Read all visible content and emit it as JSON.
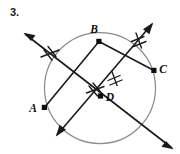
{
  "figure": {
    "problem_number": "3.",
    "canvas": {
      "width": 180,
      "height": 154
    },
    "colors": {
      "ink": "#1a1a1a",
      "circle_stroke": "#8c8c8c",
      "background": "#ffffff",
      "vertex": "#0d0d0d"
    },
    "circle": {
      "name": "circle",
      "cx": 100,
      "cy": 88,
      "r": 55.5
    },
    "points": [
      {
        "id": "A",
        "label": "A",
        "x": 44.5,
        "y": 107.5,
        "label_x": 34.5,
        "label_y": 111.0
      },
      {
        "id": "B",
        "label": "B",
        "x": 99.0,
        "y": 41.5,
        "label_x": 93.0,
        "label_y": 33.0
      },
      {
        "id": "C",
        "label": "C",
        "x": 154.0,
        "y": 70.5,
        "label_x": 160.5,
        "label_y": 72.0
      },
      {
        "id": "D",
        "label": "D",
        "x": 100.5,
        "y": 96.0,
        "label_x": 107.0,
        "label_y": 100.5
      }
    ],
    "chords": [
      {
        "id": "AB",
        "from": "A",
        "to": "B",
        "x1": 44.5,
        "y1": 107.5,
        "x2": 99.0,
        "y2": 41.5
      },
      {
        "id": "BC",
        "from": "B",
        "to": "C",
        "x1": 99.0,
        "y1": 41.5,
        "x2": 154.0,
        "y2": 70.5
      }
    ],
    "rays": [
      {
        "id": "ray-northwest-southeast",
        "description": "line through D and B-C side, arrow at upper-left and lower-right",
        "x1": 25.0,
        "y1": 34.0,
        "x2": 172.0,
        "y2": 148.0,
        "arrow_start": true,
        "arrow_end": true
      },
      {
        "id": "ray-southwest-northeast",
        "description": "line through D, arrow at lower-left and upper-right",
        "x1": 57.0,
        "y1": 135.0,
        "x2": 152.0,
        "y2": 24.0,
        "arrow_start": true,
        "arrow_end": true
      }
    ],
    "tick_marks": [
      {
        "id": "tick-upper-left",
        "cx": 49.0,
        "cy": 53.0,
        "angle": -38,
        "count": 2,
        "spacing": 5.0,
        "length": 13.0
      },
      {
        "id": "tick-upper-right",
        "cx": 138.0,
        "cy": 40.0,
        "angle": 49,
        "count": 2,
        "spacing": 5.0,
        "length": 13.0
      },
      {
        "id": "tick-near-d-upper",
        "cx": 114.0,
        "cy": 78.0,
        "angle": 49,
        "count": 2,
        "spacing": 5.0,
        "length": 12.0
      },
      {
        "id": "tick-near-d-left",
        "cx": 94.0,
        "cy": 90.0,
        "angle": -38,
        "count": 2,
        "spacing": 5.0,
        "length": 12.0
      }
    ]
  }
}
